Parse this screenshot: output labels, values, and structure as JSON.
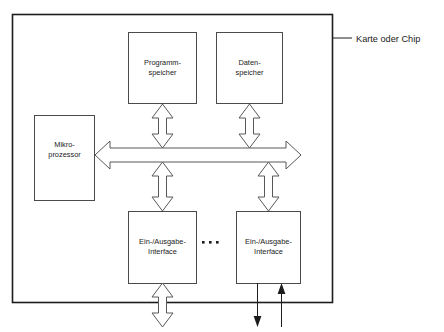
{
  "figure": {
    "title": "Karte oder Chip",
    "language": "de",
    "annotation": {
      "label": "Karte oder Chip"
    }
  },
  "blocks": {
    "program_memory": {
      "line1": "Programm-",
      "line2": "speicher"
    },
    "data_memory": {
      "line1": "Daten-",
      "line2": "speicher"
    },
    "microprocessor": {
      "line1": "Mikro-",
      "line2": "prozessor"
    },
    "io_interface_left": {
      "line1": "Ein-/Ausgabe-",
      "line2": "Interface"
    },
    "io_interface_right": {
      "line1": "Ein-/Ausgabe-",
      "line2": "Interface"
    }
  },
  "ellipsis": {
    "label": "..."
  },
  "colors": {
    "frame_stroke": "#1d1d1d",
    "box_stroke": "#4a4a4a",
    "arrow_stroke": "#585858",
    "arrow_fill": "#ffffff",
    "text": "#1a1a1a",
    "background": "#ffffff"
  }
}
